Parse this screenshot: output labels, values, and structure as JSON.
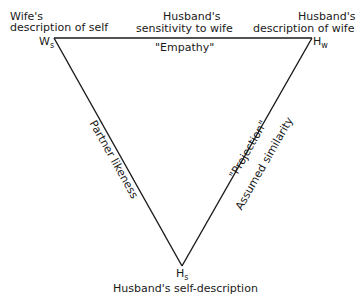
{
  "diagram": {
    "type": "triangle",
    "vertices": {
      "top_left": {
        "symbol": "W",
        "subscript": "s",
        "label_line1": "Wife's",
        "label_line2": "description of self"
      },
      "top_right": {
        "symbol": "H",
        "subscript": "w",
        "label_line1": "Husband's",
        "label_line2": "description of wife"
      },
      "bottom": {
        "symbol": "H",
        "subscript": "s",
        "label": "Husband's self-description"
      }
    },
    "edges": {
      "top": {
        "above_line1": "Husband's",
        "above_line2": "sensitivity to wife",
        "below": "\"Empathy\""
      },
      "left": {
        "label": "Partner likeness"
      },
      "right": {
        "label_outer": "\"Projection\"",
        "label_inner": "Assumed similarity"
      }
    }
  }
}
